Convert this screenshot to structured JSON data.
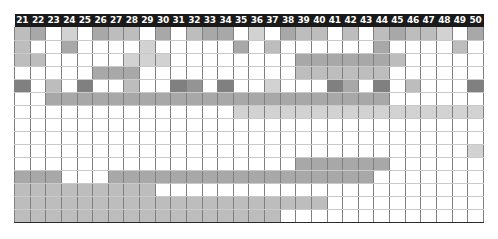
{
  "figure": {
    "name": "matrix-heatmap",
    "columns": [
      21,
      22,
      23,
      24,
      25,
      26,
      27,
      28,
      29,
      30,
      31,
      32,
      33,
      34,
      35,
      36,
      37,
      38,
      39,
      40,
      41,
      42,
      43,
      44,
      45,
      46,
      47,
      48,
      49,
      50
    ],
    "header_bg": "#1a1a1a",
    "header_fg": "#ffffff",
    "grid_line_color": "#808080",
    "separator_color": "#2b2b2b"
  },
  "chart_data": {
    "type": "heatmap",
    "title": "",
    "xlabel": "",
    "ylabel": "",
    "legend": [],
    "grid": true,
    "x": [
      21,
      22,
      23,
      24,
      25,
      26,
      27,
      28,
      29,
      30,
      31,
      32,
      33,
      34,
      35,
      36,
      37,
      38,
      39,
      40,
      41,
      42,
      43,
      44,
      45,
      46,
      47,
      48,
      49,
      50
    ],
    "palette": {
      "0": "#ffffff",
      "1": "#e8e8e8",
      "2": "#d2d2d2",
      "3": "#bdbdbd",
      "4": "#a8a8a8",
      "5": "#949494",
      "6": "#808080"
    },
    "sections": [
      {
        "name": "section-1",
        "rows": [
          {
            "name": "row-1",
            "values": [
              3,
              4,
              0,
              2,
              0,
              4,
              3,
              3,
              0,
              4,
              0,
              3,
              4,
              4,
              0,
              2,
              0,
              4,
              3,
              3,
              0,
              3,
              0,
              3,
              4,
              3,
              3,
              2,
              0,
              4
            ]
          },
          {
            "name": "row-2",
            "values": [
              3,
              0,
              0,
              4,
              0,
              0,
              0,
              0,
              2,
              0,
              0,
              0,
              0,
              0,
              4,
              0,
              3,
              0,
              0,
              0,
              0,
              0,
              0,
              4,
              0,
              0,
              0,
              0,
              3,
              0
            ]
          },
          {
            "name": "row-3",
            "values": [
              3,
              3,
              0,
              0,
              0,
              0,
              0,
              2,
              2,
              2,
              0,
              0,
              0,
              0,
              0,
              0,
              0,
              0,
              4,
              4,
              4,
              4,
              4,
              4,
              3,
              0,
              0,
              0,
              0,
              0
            ]
          },
          {
            "name": "row-4",
            "values": [
              0,
              0,
              0,
              0,
              0,
              4,
              4,
              4,
              0,
              0,
              0,
              0,
              0,
              0,
              0,
              0,
              0,
              0,
              3,
              3,
              3,
              3,
              3,
              3,
              0,
              0,
              0,
              0,
              0,
              0
            ]
          },
          {
            "name": "row-5",
            "values": [
              6,
              0,
              3,
              0,
              6,
              0,
              0,
              3,
              0,
              0,
              6,
              5,
              0,
              6,
              0,
              0,
              2,
              0,
              0,
              0,
              6,
              4,
              0,
              6,
              0,
              3,
              0,
              0,
              0,
              6
            ]
          }
        ]
      },
      {
        "name": "section-2",
        "rows": [
          {
            "name": "row-6",
            "values": [
              0,
              0,
              4,
              4,
              4,
              4,
              4,
              4,
              4,
              4,
              4,
              4,
              4,
              4,
              4,
              4,
              4,
              4,
              4,
              4,
              4,
              4,
              4,
              4,
              0,
              0,
              0,
              0,
              0,
              0
            ]
          },
          {
            "name": "row-7",
            "values": [
              0,
              0,
              0,
              0,
              0,
              0,
              0,
              0,
              0,
              0,
              0,
              0,
              0,
              0,
              2,
              2,
              2,
              2,
              2,
              2,
              2,
              2,
              2,
              2,
              2,
              2,
              2,
              2,
              2,
              2
            ]
          },
          {
            "name": "row-8",
            "values": [
              0,
              0,
              0,
              0,
              0,
              0,
              0,
              0,
              0,
              0,
              0,
              0,
              0,
              0,
              0,
              0,
              0,
              0,
              0,
              0,
              0,
              0,
              0,
              0,
              0,
              0,
              0,
              0,
              0,
              0
            ]
          },
          {
            "name": "row-9",
            "values": [
              0,
              0,
              0,
              0,
              0,
              0,
              0,
              0,
              0,
              0,
              0,
              0,
              0,
              0,
              0,
              0,
              0,
              0,
              0,
              0,
              0,
              0,
              0,
              0,
              0,
              0,
              0,
              0,
              0,
              0
            ]
          }
        ]
      },
      {
        "name": "section-3",
        "rows": [
          {
            "name": "row-10",
            "values": [
              0,
              0,
              0,
              0,
              0,
              0,
              0,
              0,
              0,
              0,
              0,
              0,
              0,
              0,
              0,
              0,
              0,
              0,
              0,
              0,
              0,
              0,
              0,
              0,
              0,
              0,
              0,
              0,
              0,
              2
            ]
          },
          {
            "name": "row-11",
            "values": [
              0,
              0,
              0,
              0,
              0,
              0,
              0,
              0,
              0,
              0,
              0,
              0,
              0,
              0,
              0,
              0,
              0,
              0,
              4,
              4,
              4,
              4,
              4,
              4,
              0,
              0,
              0,
              0,
              0,
              0
            ]
          },
          {
            "name": "row-12",
            "values": [
              4,
              4,
              4,
              0,
              0,
              0,
              4,
              4,
              4,
              4,
              4,
              4,
              4,
              4,
              4,
              4,
              4,
              4,
              4,
              4,
              4,
              4,
              4,
              0,
              0,
              0,
              0,
              0,
              0,
              0
            ]
          },
          {
            "name": "row-13",
            "values": [
              3,
              3,
              3,
              3,
              3,
              3,
              3,
              3,
              3,
              0,
              0,
              0,
              0,
              0,
              0,
              0,
              0,
              0,
              0,
              0,
              0,
              0,
              0,
              0,
              0,
              0,
              0,
              0,
              0,
              0
            ]
          },
          {
            "name": "row-14",
            "values": [
              3,
              3,
              3,
              3,
              3,
              3,
              3,
              3,
              3,
              3,
              3,
              3,
              3,
              3,
              3,
              3,
              3,
              3,
              3,
              3,
              0,
              0,
              0,
              0,
              0,
              0,
              0,
              0,
              0,
              0
            ]
          }
        ]
      },
      {
        "name": "section-4",
        "rows": [
          {
            "name": "row-15",
            "values": [
              3,
              3,
              3,
              3,
              3,
              3,
              3,
              3,
              3,
              3,
              3,
              3,
              3,
              3,
              3,
              3,
              3,
              0,
              0,
              0,
              0,
              0,
              0,
              0,
              0,
              0,
              0,
              0,
              0,
              0
            ]
          }
        ]
      }
    ]
  }
}
